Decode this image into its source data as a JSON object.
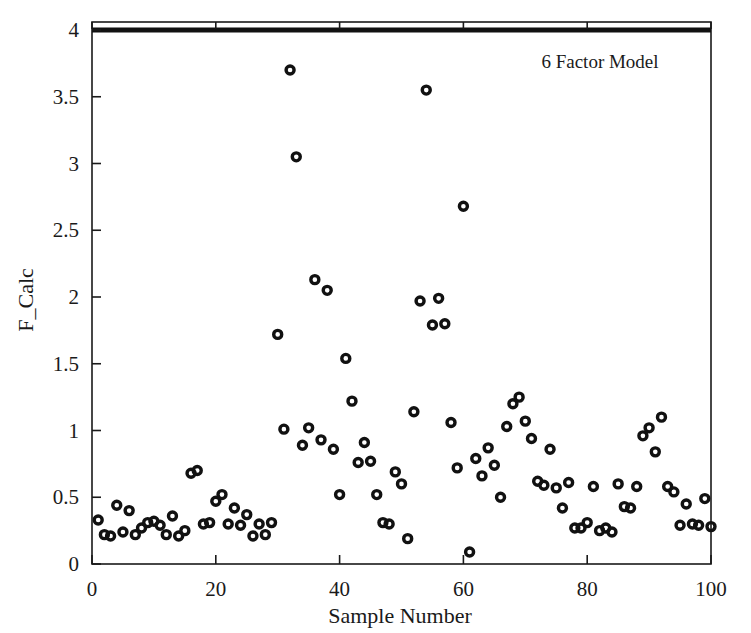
{
  "figure": {
    "annotation": "6 Factor Model",
    "marker_style": "open-circle-ring",
    "marker_color": "#111111",
    "background_color": "#ffffff",
    "axis_color": "#1a1a1a"
  },
  "chart_data": {
    "type": "scatter",
    "title": "",
    "annotations": [
      "6 Factor Model"
    ],
    "xlabel": "Sample Number",
    "ylabel": "F_Calc",
    "xlim": [
      0,
      100
    ],
    "ylim": [
      0,
      4
    ],
    "xticks": [
      0,
      20,
      40,
      60,
      80,
      100
    ],
    "yticks": [
      0,
      0.5,
      1,
      1.5,
      2,
      2.5,
      3,
      3.5,
      4
    ],
    "xtick_labels": [
      "0",
      "20",
      "40",
      "60",
      "80",
      "100"
    ],
    "ytick_labels": [
      "0",
      "0.5",
      "1",
      "1.5",
      "2",
      "2.5",
      "3",
      "3.5",
      "4"
    ],
    "grid": false,
    "legend": null,
    "series": [
      {
        "name": "F_Calc",
        "marker": "open circle",
        "x": [
          1,
          2,
          3,
          4,
          5,
          6,
          7,
          8,
          9,
          10,
          11,
          12,
          13,
          14,
          15,
          16,
          17,
          18,
          19,
          20,
          21,
          22,
          23,
          24,
          25,
          26,
          27,
          28,
          29,
          30,
          31,
          32,
          33,
          34,
          35,
          36,
          37,
          38,
          39,
          40,
          41,
          42,
          43,
          44,
          45,
          46,
          47,
          48,
          49,
          50,
          51,
          52,
          53,
          54,
          55,
          56,
          57,
          58,
          59,
          60,
          61,
          62,
          63,
          64,
          65,
          66,
          67,
          68,
          69,
          70,
          71,
          72,
          73,
          74,
          75,
          76,
          77,
          78,
          79,
          80,
          81,
          82,
          83,
          84,
          85,
          86,
          87,
          88,
          89,
          90,
          91,
          92,
          93,
          94,
          95,
          96,
          97,
          98,
          99,
          100
        ],
        "y": [
          0.33,
          0.22,
          0.21,
          0.44,
          0.24,
          0.4,
          0.22,
          0.27,
          0.31,
          0.32,
          0.29,
          0.22,
          0.36,
          0.21,
          0.25,
          0.68,
          0.7,
          0.3,
          0.31,
          0.47,
          0.52,
          0.3,
          0.42,
          0.29,
          0.37,
          0.21,
          0.3,
          0.22,
          0.31,
          1.72,
          1.01,
          3.7,
          3.05,
          0.89,
          1.02,
          2.13,
          0.93,
          2.05,
          0.86,
          0.52,
          1.54,
          1.22,
          0.76,
          0.91,
          0.77,
          0.52,
          0.31,
          0.3,
          0.69,
          0.6,
          0.19,
          1.14,
          1.97,
          3.55,
          1.79,
          1.99,
          1.8,
          1.06,
          0.72,
          2.68,
          0.09,
          0.79,
          0.66,
          0.87,
          0.74,
          0.5,
          1.03,
          1.2,
          1.25,
          1.07,
          0.94,
          0.62,
          0.59,
          0.86,
          0.57,
          0.42,
          0.61,
          0.27,
          0.27,
          0.31,
          0.58,
          0.25,
          0.27,
          0.24,
          0.6,
          0.43,
          0.42,
          0.58,
          0.96,
          1.02,
          0.84,
          1.1,
          0.58,
          0.54,
          0.29,
          0.45,
          0.3,
          0.29,
          0.49,
          0.28
        ]
      }
    ]
  }
}
